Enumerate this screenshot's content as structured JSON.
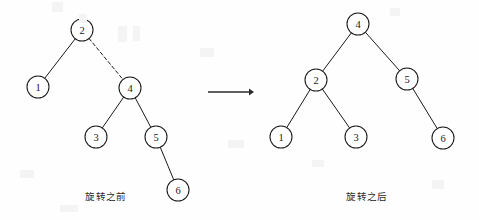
{
  "figure": {
    "title_left": "旋转之前",
    "title_right": "旋转之后",
    "arrow_label": "",
    "background_color": "#fefefe",
    "stroke_color": "#1a1a1a",
    "arrow_color": "#2b2b2b",
    "caption_color": "#2a2a2a"
  },
  "trees": [
    {
      "name": "before-rotation",
      "caption": "旋转之前",
      "caption_position": {
        "x": 106,
        "y": 196
      },
      "node_radius": 11,
      "nodes": [
        {
          "id": "L2",
          "label": "2",
          "x": 82,
          "y": 30
        },
        {
          "id": "L1",
          "label": "1",
          "x": 38,
          "y": 87
        },
        {
          "id": "L4",
          "label": "4",
          "x": 130,
          "y": 88
        },
        {
          "id": "L3",
          "label": "3",
          "x": 96,
          "y": 137
        },
        {
          "id": "L5",
          "label": "5",
          "x": 156,
          "y": 137
        },
        {
          "id": "L6",
          "label": "6",
          "x": 178,
          "y": 190
        }
      ],
      "edges": [
        {
          "from": "L2",
          "to": "L1",
          "style": "solid"
        },
        {
          "from": "L2",
          "to": "L4",
          "style": "dashed"
        },
        {
          "from": "L4",
          "to": "L3",
          "style": "solid"
        },
        {
          "from": "L4",
          "to": "L5",
          "style": "solid"
        },
        {
          "from": "L5",
          "to": "L6",
          "style": "solid"
        }
      ]
    },
    {
      "name": "after-rotation",
      "caption": "旋转之后",
      "caption_position": {
        "x": 367,
        "y": 196
      },
      "node_radius": 11,
      "nodes": [
        {
          "id": "R4",
          "label": "4",
          "x": 358,
          "y": 24
        },
        {
          "id": "R2",
          "label": "2",
          "x": 316,
          "y": 80
        },
        {
          "id": "R5",
          "label": "5",
          "x": 407,
          "y": 79
        },
        {
          "id": "R1",
          "label": "1",
          "x": 281,
          "y": 137
        },
        {
          "id": "R3",
          "label": "3",
          "x": 356,
          "y": 137
        },
        {
          "id": "R6",
          "label": "6",
          "x": 443,
          "y": 138
        }
      ],
      "edges": [
        {
          "from": "R4",
          "to": "R2",
          "style": "solid"
        },
        {
          "from": "R4",
          "to": "R5",
          "style": "solid"
        },
        {
          "from": "R2",
          "to": "R1",
          "style": "solid"
        },
        {
          "from": "R2",
          "to": "R3",
          "style": "solid"
        },
        {
          "from": "R5",
          "to": "R6",
          "style": "solid"
        }
      ]
    }
  ],
  "arrow": {
    "x1": 208,
    "y1": 92,
    "x2": 254,
    "y2": 92,
    "head_size": 5
  }
}
